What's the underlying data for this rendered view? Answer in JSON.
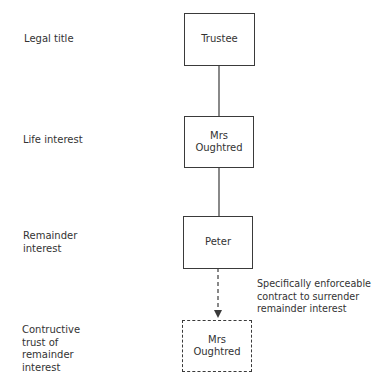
{
  "rows": [
    {
      "label": "Legal title",
      "node": "Trustee",
      "style": "solid"
    },
    {
      "label": "Life interest",
      "node": "Mrs Oughtred",
      "style": "solid"
    },
    {
      "label": "Remainder interest",
      "node": "Peter",
      "style": "solid"
    },
    {
      "label": "Contructive trust of remainder interest",
      "node": "Mrs Oughtred",
      "style": "dashed"
    }
  ],
  "labels": {
    "row0": [
      "Legal title"
    ],
    "row1": [
      "Life interest"
    ],
    "row2": [
      "Remainder",
      "interest"
    ],
    "row3": [
      "Contructive",
      "trust of",
      "remainder",
      "interest"
    ]
  },
  "nodes": {
    "trustee": [
      "Trustee"
    ],
    "life": [
      "Mrs",
      "Oughtred"
    ],
    "remainder": [
      "Peter"
    ],
    "constructive": [
      "Mrs",
      "Oughtred"
    ]
  },
  "edges": [
    {
      "from": "Trustee",
      "to": "Mrs Oughtred",
      "style": "solid"
    },
    {
      "from": "Mrs Oughtred",
      "to": "Peter",
      "style": "solid"
    },
    {
      "from": "Peter",
      "to": "Mrs Oughtred (constructive trust)",
      "style": "dashed-arrow",
      "label": "Specifically enforceable contract to surrender remainder interest"
    }
  ],
  "edge_label": [
    "Specifically enforceable",
    "contract to surrender",
    "remainder interest"
  ]
}
